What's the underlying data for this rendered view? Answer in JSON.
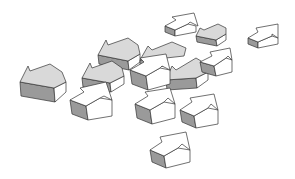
{
  "illustration": {
    "subject": "scattered 3D block arrows",
    "arrow_count": 14,
    "colors": {
      "background": "#ffffff",
      "arrow_face_light": "#ffffff",
      "arrow_face_gray": "#d9d9d9",
      "arrow_side_dark": "#9a9a9a",
      "outline": "#333333"
    },
    "directions": {
      "left_pointing_gray": 6,
      "up_right_pointing_white": 8
    }
  }
}
